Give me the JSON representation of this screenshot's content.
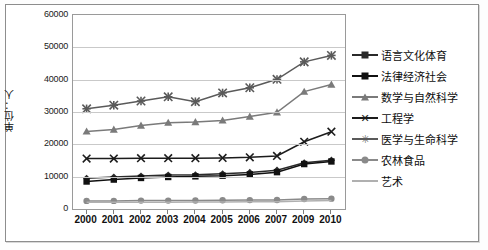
{
  "chart_data": {
    "type": "line",
    "title": "",
    "xlabel": "",
    "ylabel": "单位：人",
    "categories": [
      "2000",
      "2001",
      "2002",
      "2003",
      "2004",
      "2005",
      "2006",
      "2007",
      "2009",
      "2010"
    ],
    "ylim": [
      0,
      60000
    ],
    "ytick_values": [
      0,
      10000,
      20000,
      30000,
      40000,
      50000,
      60000
    ],
    "ytick_labels": [
      "0",
      "10000",
      "20000",
      "30000",
      "40000",
      "50000",
      "60000"
    ],
    "grid": true,
    "legend_position": "right",
    "series": [
      {
        "name": "语言文化体育",
        "marker": "diamond",
        "color": "#2a2a2a",
        "values": [
          9500,
          9900,
          10200,
          10500,
          10600,
          10900,
          11300,
          12000,
          14300,
          15100
        ]
      },
      {
        "name": "法律经济社会",
        "marker": "square",
        "color": "#111111",
        "values": [
          8500,
          9100,
          9600,
          9900,
          10100,
          10300,
          10700,
          11400,
          13900,
          14700
        ]
      },
      {
        "name": "数学与自然科学",
        "marker": "triangle",
        "color": "#7a7a7a",
        "values": [
          24000,
          24600,
          25800,
          26700,
          26900,
          27400,
          28600,
          29900,
          36300,
          38500
        ]
      },
      {
        "name": "工程学",
        "marker": "x",
        "color": "#1c1c1c",
        "values": [
          15600,
          15600,
          15700,
          15700,
          15700,
          15800,
          16000,
          16400,
          20800,
          23900
        ]
      },
      {
        "name": "医学与生命科学",
        "marker": "star",
        "color": "#5a5a5a",
        "values": [
          31000,
          32100,
          33400,
          34700,
          33200,
          35900,
          37500,
          40100,
          45500,
          47500
        ]
      },
      {
        "name": "农林食品",
        "marker": "circle",
        "color": "#8a8a8a",
        "values": [
          2500,
          2500,
          2600,
          2600,
          2650,
          2700,
          2750,
          2800,
          3100,
          3200
        ]
      },
      {
        "name": "艺术",
        "marker": "none",
        "color": "#b0b0b0",
        "values": [
          2050,
          2080,
          2100,
          2120,
          2150,
          2180,
          2220,
          2280,
          2500,
          2600
        ]
      }
    ]
  }
}
